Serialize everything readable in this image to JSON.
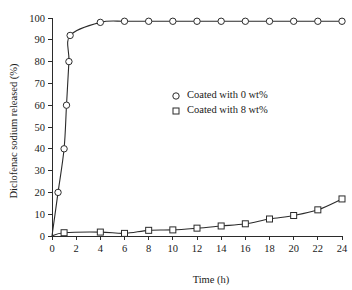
{
  "chart_data": {
    "type": "line",
    "title": "",
    "xlabel": "Time (h)",
    "ylabel": "Diclofenac sodium released (%)",
    "xlim": [
      0,
      24
    ],
    "ylim": [
      0,
      100
    ],
    "xticks": [
      0,
      2,
      4,
      6,
      8,
      10,
      12,
      14,
      16,
      18,
      20,
      22,
      24
    ],
    "yticks": [
      0,
      10,
      20,
      30,
      40,
      50,
      60,
      70,
      80,
      90,
      100
    ],
    "xtick_labels": [
      "0",
      "2",
      "4",
      "6",
      "8",
      "10",
      "12",
      "14",
      "16",
      "18",
      "20",
      "22",
      "24"
    ],
    "ytick_labels": [
      "0",
      "10",
      "20",
      "30",
      "40",
      "50",
      "60",
      "70",
      "80",
      "90",
      "100"
    ],
    "grid": false,
    "legend_position": "upper-right-inside",
    "series": [
      {
        "name": "Coated with 0 wt%",
        "marker": "circle",
        "color": "#2b2b2b",
        "x": [
          0,
          0.5,
          1.0,
          1.2,
          1.4,
          1.5,
          4,
          6,
          8,
          10,
          12,
          14,
          16,
          18,
          20,
          22,
          24
        ],
        "y": [
          0,
          20,
          40,
          60,
          80,
          92,
          98,
          98.5,
          98.5,
          98.5,
          98.5,
          98.5,
          98.5,
          98.5,
          98.5,
          98.5,
          98.5
        ],
        "marker_x": [
          0.5,
          1.0,
          1.2,
          1.4,
          1.5,
          4,
          6,
          8,
          10,
          12,
          14,
          16,
          18,
          20,
          22,
          24
        ],
        "marker_y": [
          20,
          40,
          60,
          80,
          92,
          98,
          98.5,
          98.5,
          98.5,
          98.5,
          98.5,
          98.5,
          98.5,
          98.5,
          98.5,
          98.5
        ]
      },
      {
        "name": "Coated with 8 wt%",
        "marker": "square",
        "color": "#2b2b2b",
        "x": [
          0,
          1,
          4,
          6,
          8,
          10,
          12,
          14,
          16,
          18,
          20,
          22,
          24
        ],
        "y": [
          0,
          1.5,
          1.8,
          1.2,
          2.6,
          2.8,
          3.6,
          4.6,
          5.6,
          7.8,
          9.4,
          12.0,
          17.0
        ],
        "marker_x": [
          1,
          4,
          6,
          8,
          10,
          12,
          14,
          16,
          18,
          20,
          22,
          24
        ],
        "marker_y": [
          1.5,
          1.8,
          1.2,
          2.6,
          2.8,
          3.6,
          4.6,
          5.6,
          7.8,
          9.4,
          12.0,
          17.0
        ]
      }
    ],
    "legend": [
      {
        "label": "Coated with 0 wt%",
        "marker": "circle"
      },
      {
        "label": "Coated with 8 wt%",
        "marker": "square"
      }
    ]
  }
}
